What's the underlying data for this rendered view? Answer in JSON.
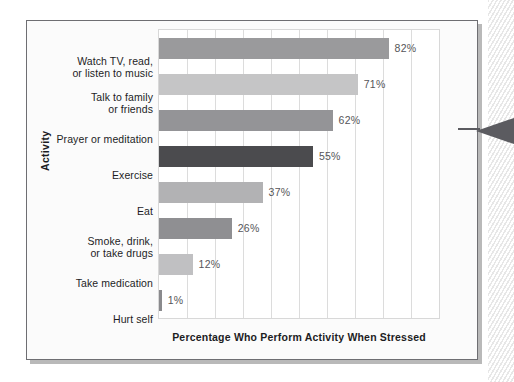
{
  "figure": {
    "y_axis_title": "Activity",
    "x_axis_title": "Percentage Who Perform Activity When Stressed"
  },
  "chart_data": {
    "type": "bar",
    "orientation": "horizontal",
    "title": "",
    "subtitle": "",
    "xlabel": "Percentage Who Perform Activity When Stressed",
    "ylabel": "Activity",
    "xlim": [
      0,
      100
    ],
    "grid": true,
    "grid_axis": "x",
    "grid_interval": 10,
    "legend": false,
    "tick_labels_x": [],
    "categories": [
      "Watch TV, read, or listen to music",
      "Talk to family or friends",
      "Prayer or meditation",
      "Exercise",
      "Eat",
      "Smoke, drink, or take drugs",
      "Take medication",
      "Hurt self"
    ],
    "category_lines": [
      [
        "Watch TV, read,",
        "or listen to music"
      ],
      [
        "Talk to family",
        "or friends"
      ],
      [
        "Prayer or meditation"
      ],
      [
        "Exercise"
      ],
      [
        "Eat"
      ],
      [
        "Smoke, drink,",
        "or take drugs"
      ],
      [
        "Take medication"
      ],
      [
        "Hurt self"
      ]
    ],
    "values": [
      82,
      71,
      62,
      55,
      37,
      26,
      12,
      1
    ],
    "data_labels": [
      "82%",
      "71%",
      "62%",
      "55%",
      "37%",
      "26%",
      "12%",
      "1%"
    ],
    "bar_colors": [
      "#9a9a9c",
      "#c5c5c6",
      "#949497",
      "#4b4b4e",
      "#b2b2b4",
      "#8f8f92",
      "#c0c0c2",
      "#8a8a8d"
    ]
  },
  "colors": {
    "frame_border": "#6e6e72",
    "frame_background": "#fbfbfb",
    "plot_background": "#ffffff",
    "gridline": "#dcdcdc",
    "label_text": "#1d1d1f",
    "value_text": "#555558",
    "pointer": "#5b5b60"
  }
}
